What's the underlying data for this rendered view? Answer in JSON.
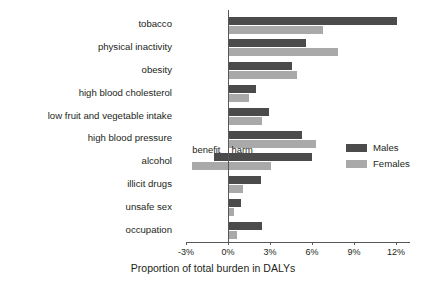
{
  "chart_data": {
    "type": "bar",
    "orientation": "horizontal",
    "title": "",
    "xlabel": "Proportion of total burden in DALYs",
    "ylabel": "",
    "xlim": [
      -3,
      13
    ],
    "xticks": [
      -3,
      0,
      3,
      6,
      9,
      12
    ],
    "xtick_labels": [
      "-3%",
      "0%",
      "3%",
      "6%",
      "9%",
      "12%"
    ],
    "grid": false,
    "legend_position": "right-middle",
    "categories": [
      "tobacco",
      "physical inactivity",
      "obesity",
      "high blood cholesterol",
      "low fruit and vegetable intake",
      "high blood pressure",
      "alcohol",
      "illicit drugs",
      "unsafe sex",
      "occupation"
    ],
    "series": [
      {
        "name": "Males",
        "color": "#4b4b4b",
        "values": [
          12.1,
          5.55,
          4.6,
          2.0,
          2.95,
          5.25,
          6.0,
          2.35,
          0.95,
          2.4
        ]
      },
      {
        "name": "Females",
        "color": "#a9a9a9",
        "values": [
          6.8,
          7.85,
          4.9,
          1.5,
          2.45,
          6.3,
          3.1,
          1.1,
          0.45,
          0.65
        ]
      }
    ],
    "series_negative_start": [
      {
        "name": "Males",
        "category": "alcohol",
        "start": -1.0
      },
      {
        "name": "Females",
        "category": "alcohol",
        "start": -2.6
      }
    ],
    "annotations": [
      {
        "name": "benefit",
        "text": "benefit"
      },
      {
        "name": "harm",
        "text": "harm"
      }
    ]
  },
  "legend": {
    "items": [
      {
        "label": "Males",
        "color": "#4b4b4b"
      },
      {
        "label": "Females",
        "color": "#a9a9a9"
      }
    ]
  },
  "axis": {
    "title": "Proportion of total burden in DALYs"
  }
}
